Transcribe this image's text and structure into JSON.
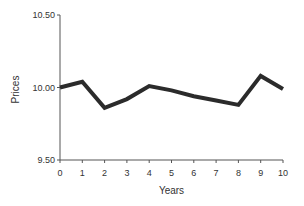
{
  "chart_data": {
    "type": "line",
    "title": "",
    "xlabel": "Years",
    "ylabel": "Prices",
    "x": [
      0,
      1,
      2,
      3,
      4,
      5,
      6,
      7,
      8,
      9,
      10
    ],
    "series": [
      {
        "name": "Prices",
        "values": [
          10.0,
          10.04,
          9.86,
          9.92,
          10.01,
          9.98,
          9.94,
          9.91,
          9.88,
          10.08,
          9.99
        ],
        "color": "#2b2b2b"
      }
    ],
    "xlim": [
      0,
      10
    ],
    "ylim": [
      9.5,
      10.5
    ],
    "x_ticks": [
      "0",
      "1",
      "2",
      "3",
      "4",
      "5",
      "6",
      "7",
      "8",
      "9",
      "10"
    ],
    "y_ticks": [
      "9.50",
      "10.00",
      "10.50"
    ],
    "grid": false,
    "legend": null
  }
}
